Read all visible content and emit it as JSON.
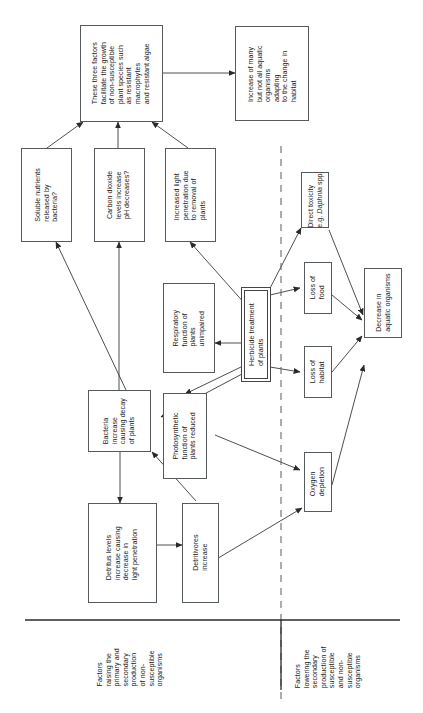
{
  "diagram": {
    "type": "flowchart",
    "orientation": "rotated-90-ccw",
    "divider_color": "#555a5e",
    "box_border_color": "#555a5e",
    "text_color": "#1b1b1b",
    "nodes": [
      {
        "id": "three-factors",
        "label": "These three factors\nfacilitate the growth\nof non-susceptible\nplant species such\nas resistant\nmacrophytes\nand resistant algae"
      },
      {
        "id": "increase-aquatic",
        "label": "Increase of many\nbut not all aquatic\norganisms\nadapting\nto the change in\nhabitat"
      },
      {
        "id": "soluble-nutrients",
        "label": "Soluble nutrients\nreleased by\nbacteria?"
      },
      {
        "id": "carbon-dioxide",
        "label": "Carbon dioxide\nlevels increase\npH decreases?"
      },
      {
        "id": "increased-light",
        "label": "Increased light\npenetration due\nto removal of\nplants"
      },
      {
        "id": "respiratory-function",
        "label": "Respiratory\nfunction of\nplants\nunimpaired"
      },
      {
        "id": "herbicide-treatment",
        "label": "Herbicide treatment\nof plants"
      },
      {
        "id": "bacteria-increase",
        "label": "Bacteria\nincrease\ncausing decay\nof plants"
      },
      {
        "id": "photosynthetic-function",
        "label": "Photosynthetic\nfunction of\nplants reduced"
      },
      {
        "id": "detritus-levels",
        "label": "Detritus levels\nincrease causing\ndecrease in\nlight penetration"
      },
      {
        "id": "detritivores-increase",
        "label": "Detritivores\nincrease"
      },
      {
        "id": "direct-toxicity",
        "label_line1": "Direct toxicity",
        "label_line2_pre": "e.g. ",
        "label_line2_italic": "Daphnia",
        "label_line2_post": " spp."
      },
      {
        "id": "loss-of-food",
        "label": "Loss of\nfood"
      },
      {
        "id": "loss-of-habitat",
        "label": "Loss of\nhabitat"
      },
      {
        "id": "oxygen-depletion",
        "label": "Oxygen\ndepletion"
      },
      {
        "id": "decrease-aquatic",
        "label": "Decrease in\naquatic organisms"
      }
    ],
    "captions": [
      {
        "id": "caption-left",
        "label": "Factors\nraising the\nprimary and\nsecondary\nproduction\nof non-\nsusceptible\norganisms"
      },
      {
        "id": "caption-right",
        "label": "Factors\nlowering the\nsecondary\nproduction of\nsusceptible\nand non-\nsusceptible\norganisms"
      }
    ],
    "edges": [
      {
        "from": "three-factors",
        "to": "increase-aquatic"
      },
      {
        "from": "soluble-nutrients",
        "to": "three-factors"
      },
      {
        "from": "carbon-dioxide",
        "to": "three-factors"
      },
      {
        "from": "increased-light",
        "to": "three-factors"
      },
      {
        "from": "bacteria-increase",
        "to": "soluble-nutrients"
      },
      {
        "from": "bacteria-increase",
        "to": "carbon-dioxide"
      },
      {
        "from": "herbicide-treatment",
        "to": "increased-light"
      },
      {
        "from": "herbicide-treatment",
        "to": "respiratory-function"
      },
      {
        "from": "herbicide-treatment",
        "to": "photosynthetic-function"
      },
      {
        "from": "herbicide-treatment",
        "to": "bacteria-increase"
      },
      {
        "from": "herbicide-treatment",
        "to": "direct-toxicity"
      },
      {
        "from": "herbicide-treatment",
        "to": "loss-of-food"
      },
      {
        "from": "herbicide-treatment",
        "to": "loss-of-habitat"
      },
      {
        "from": "bacteria-increase",
        "to": "detritus-levels"
      },
      {
        "from": "detritus-levels",
        "to": "detritivores-increase"
      },
      {
        "from": "detritivores-increase",
        "to": "bacteria-increase"
      },
      {
        "from": "photosynthetic-function",
        "to": "oxygen-depletion"
      },
      {
        "from": "detritivores-increase",
        "to": "oxygen-depletion"
      },
      {
        "from": "direct-toxicity",
        "to": "decrease-aquatic"
      },
      {
        "from": "loss-of-food",
        "to": "decrease-aquatic"
      },
      {
        "from": "loss-of-habitat",
        "to": "decrease-aquatic"
      },
      {
        "from": "oxygen-depletion",
        "to": "decrease-aquatic"
      }
    ]
  }
}
